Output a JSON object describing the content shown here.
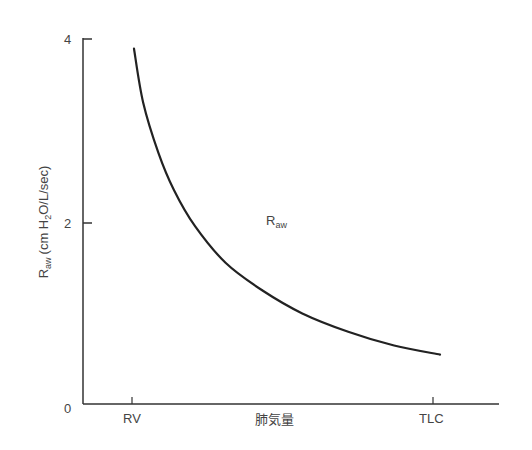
{
  "chart_data": {
    "type": "line",
    "title": "",
    "xlabel": "肺気量",
    "ylabel": "Raw (cm H2O/L/sec)",
    "ylabel_parts": {
      "main": "R",
      "sub": "aw",
      "unit_pre": "(cm H",
      "unit_sub": "2",
      "unit_post": "O/L/sec)"
    },
    "x_ticks": [
      "RV",
      "TLC"
    ],
    "y_ticks": [
      "0",
      "2",
      "4"
    ],
    "ylim": [
      0,
      4
    ],
    "grid": false,
    "legend": null,
    "annotations": [
      {
        "text_main": "R",
        "text_sub": "aw",
        "x": 0.42,
        "y": 2.0
      }
    ],
    "series": [
      {
        "name": "Raw",
        "x": [
          0.0,
          0.03,
          0.08,
          0.13,
          0.2,
          0.3,
          0.42,
          0.55,
          0.7,
          0.85,
          1.0
        ],
        "values": [
          3.89,
          3.3,
          2.75,
          2.35,
          1.95,
          1.55,
          1.25,
          1.0,
          0.8,
          0.65,
          0.55
        ]
      }
    ]
  }
}
